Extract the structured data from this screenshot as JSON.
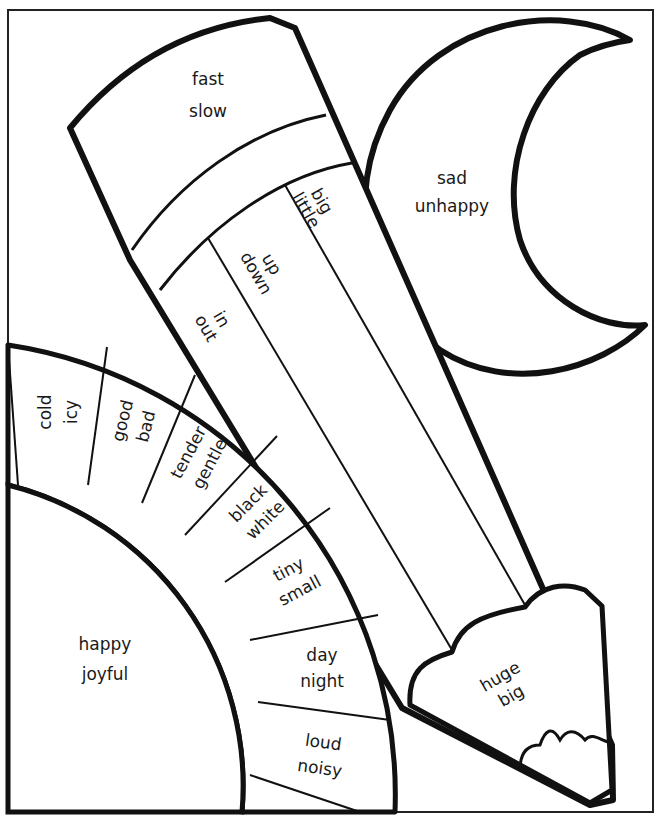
{
  "worksheet": {
    "type": "coloring-page",
    "colors": {
      "ink": "#111111",
      "paper": "#ffffff"
    }
  },
  "pencil": {
    "eraser": {
      "line1": "fast",
      "line2": "slow"
    },
    "stripes": [
      {
        "line1": "big",
        "line2": "little"
      },
      {
        "line1": "up",
        "line2": "down"
      },
      {
        "line1": "in",
        "line2": "out"
      }
    ],
    "tip": {
      "line1": "huge",
      "line2": "big"
    }
  },
  "moon": {
    "line1": "sad",
    "line2": "unhappy"
  },
  "rainbow": {
    "center": {
      "line1": "happy",
      "line2": "joyful"
    },
    "segments": [
      {
        "line1": "cold",
        "line2": "icy"
      },
      {
        "line1": "good",
        "line2": "bad"
      },
      {
        "line1": "tender",
        "line2": "gentle"
      },
      {
        "line1": "black",
        "line2": "white"
      },
      {
        "line1": "tiny",
        "line2": "small"
      },
      {
        "line1": "day",
        "line2": "night"
      },
      {
        "line1": "loud",
        "line2": "noisy"
      }
    ]
  }
}
